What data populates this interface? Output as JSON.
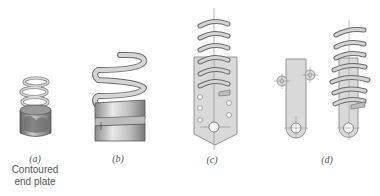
{
  "figure": {
    "panels": [
      {
        "id": "a",
        "label": "(a)",
        "caption_line1": "Contoured",
        "caption_line2": "end plate",
        "subject": "spring-with-contoured-end-plate"
      },
      {
        "id": "b",
        "label": "(b)",
        "subject": "spring-with-sleeve-end"
      },
      {
        "id": "c",
        "label": "(c)",
        "subject": "spring-on-perforated-plate-with-pin-hole"
      },
      {
        "id": "d",
        "label": "(d)",
        "subject": "spring-on-lever-arm-with-pin-holes"
      }
    ],
    "colors": {
      "background": "#ffffff",
      "spring_fill": "#c8c8c8",
      "spring_stroke": "#6a6a6a",
      "plate_fill": "#d9d9d9",
      "plate_stroke": "#8a8a8a",
      "label_text": "#555555"
    }
  }
}
